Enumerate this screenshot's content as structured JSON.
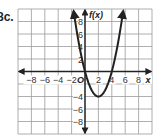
{
  "problem_label": "8c.",
  "chart_data": {
    "type": "line",
    "title": "",
    "function": "f(x) = x^2 - 4x",
    "xlabel": "x",
    "ylabel": "f(x)",
    "origin_label": "O",
    "xlim": [
      -10,
      10
    ],
    "ylim": [
      -10,
      10
    ],
    "grid": true,
    "grid_step": 2,
    "x_ticks": [
      "-8",
      "-6",
      "-4",
      "-2",
      "2",
      "4",
      "6",
      "8"
    ],
    "y_ticks": [
      "8",
      "6",
      "4",
      "2",
      "-4",
      "-6",
      "-8"
    ],
    "series": [
      {
        "name": "f(x)",
        "x": [
          -1.7,
          -1,
          0,
          1,
          2,
          3,
          4,
          5,
          5.7
        ],
        "y": [
          9.7,
          5,
          0,
          -3,
          -4,
          -3,
          0,
          5,
          9.7
        ],
        "vertex": [
          2,
          -4
        ],
        "roots": [
          0,
          4
        ],
        "arrows_at_ends": true
      }
    ]
  }
}
